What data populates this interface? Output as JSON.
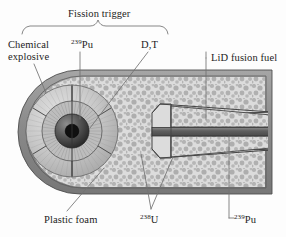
{
  "figure": {
    "labels": {
      "fission_trigger": "Fission trigger",
      "chemical_explosive_line1": "Chemical",
      "chemical_explosive_line2": "explosive",
      "pu239_top_sup": "239",
      "pu239_top_text": "Pu",
      "dt": "D,T",
      "lid_fusion_fuel": "LiD fusion fuel",
      "plastic_foam": "Plastic foam",
      "u238_sup": "238",
      "u238_text": "U",
      "pu239_bottom_sup": "239",
      "pu239_bottom_text": "Pu"
    },
    "colors": {
      "casing_outer": "#8f8f8f",
      "casing_inner": "#b4b4b4",
      "foam_fill": "#d9d9d9",
      "foam_speckle": "#b0b0b0",
      "fusion_fuel_fill": "#d2d2d2",
      "pu_rod": "#6e6e6e",
      "explosive_ring": "#c9c9c9",
      "tamper_ring": "#a8a8a8",
      "core_dark": "#2a2a2a",
      "pit_black": "#111111",
      "leader_line": "#6a6a6a",
      "outline": "#4a4a4a",
      "text": "#1c1c1c",
      "background": "#ffffff"
    },
    "parts": [
      {
        "name": "fission-trigger",
        "type": "sphere-assembly",
        "cx": 72,
        "cy": 131,
        "r_outer": 46
      },
      {
        "name": "chemical-explosive-shell",
        "type": "annulus",
        "r_in": 30,
        "r_out": 46
      },
      {
        "name": "pu239-pit",
        "type": "sphere",
        "r": 17
      },
      {
        "name": "dt-booster-core",
        "type": "sphere",
        "r": 7
      },
      {
        "name": "lid-fusion-fuel",
        "type": "tapered-cylinder"
      },
      {
        "name": "u238-tamper",
        "type": "shell"
      },
      {
        "name": "pu239-spark-plug",
        "type": "rod"
      },
      {
        "name": "plastic-foam",
        "type": "fill"
      },
      {
        "name": "outer-casing",
        "type": "capsule"
      }
    ]
  }
}
